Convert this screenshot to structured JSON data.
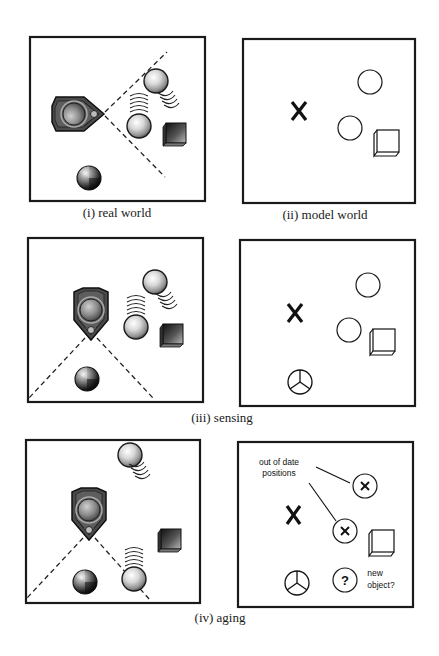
{
  "figure": {
    "panels": [
      {
        "id": "i",
        "title": "real world",
        "caption": "(i)  real world",
        "kind": "real"
      },
      {
        "id": "ii",
        "title": "model world",
        "caption": "(ii)  model world",
        "kind": "model"
      },
      {
        "id": "iii-real",
        "kind": "real"
      },
      {
        "id": "iii-model",
        "kind": "model"
      },
      {
        "id": "iv-real",
        "kind": "real"
      },
      {
        "id": "iv-model",
        "kind": "model"
      }
    ],
    "captions": {
      "i": "(i)  real world",
      "ii": "(ii)  model world",
      "iii": "(iii)  sensing",
      "iv": "(iv)  aging"
    },
    "annotations": {
      "out_of_date_line1": "out of date",
      "out_of_date_line2": "positions",
      "question_mark": "?",
      "new_object_line1": "new",
      "new_object_line2": "object?",
      "robot_marker": "X"
    },
    "legend_semantics": {
      "robot-icon": "robot with sensor cone (dashed lines)",
      "sphere-icon": "moving ball with motion waves",
      "cube-icon": "static box object",
      "shaded-sphere-icon": "stationary shaded ball",
      "x-marker": "robot position in model",
      "empty-circle": "modelled ball position",
      "crossed-circle": "out-of-date ball position",
      "segmented-circle": "newly sensed object",
      "question-circle": "possible new object"
    },
    "colors": {
      "frame": "#1a1a1a",
      "robot_body": "#4a4a4a",
      "robot_dark": "#2a2a2a",
      "sphere_light": "#f2f2f2",
      "sphere_mid": "#9a9a9a",
      "cube_dark": "#222222",
      "cube_light": "#bdbdbd",
      "background": "#ffffff"
    }
  }
}
